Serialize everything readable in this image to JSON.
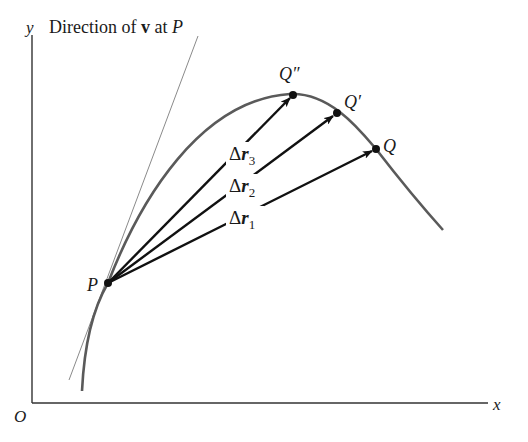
{
  "figure": {
    "title_prefix": "Direction of ",
    "title_vector": "v",
    "title_mid": " at ",
    "title_point": "P",
    "axes": {
      "x_label": "x",
      "y_label": "y",
      "origin_label": "O"
    },
    "points": {
      "P": "P",
      "Q": "Q",
      "Q_prime": "Q′",
      "Q_double_prime": "Q″"
    },
    "vectors": [
      {
        "delta": "Δ",
        "symbol": "r",
        "sub": "1"
      },
      {
        "delta": "Δ",
        "symbol": "r",
        "sub": "2"
      },
      {
        "delta": "Δ",
        "symbol": "r",
        "sub": "3"
      }
    ],
    "colors": {
      "curve": "#5a5a5a",
      "tangent": "#8a8a8a",
      "arrows": "#111111",
      "axes": "#333333",
      "points": "#111111"
    }
  }
}
